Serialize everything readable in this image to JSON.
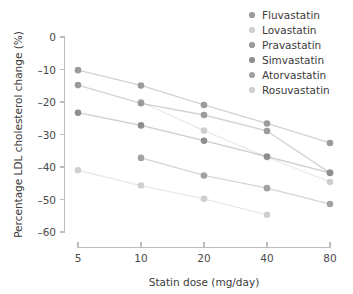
{
  "chart_data": {
    "type": "line",
    "title": "",
    "xlabel": "Statin dose (mg/day)",
    "ylabel": "Percentage LDL cholesterol change (%)",
    "x_scale": "log2-like categorical",
    "x": [
      5,
      10,
      20,
      40,
      80
    ],
    "xtick_labels": [
      "5",
      "10",
      "20",
      "40",
      "80"
    ],
    "ytick_labels": [
      "0",
      "–10",
      "–20",
      "–30",
      "–40",
      "–50",
      "–60"
    ],
    "yticks": [
      0,
      -10,
      -20,
      -30,
      -40,
      -50,
      -60
    ],
    "ylim": [
      -60,
      0
    ],
    "grid": false,
    "legend_position": "top-right",
    "series": [
      {
        "name": "Fluvastatin",
        "color": "#9b9b9b",
        "x": [
          5,
          10,
          20,
          40,
          80
        ],
        "values": [
          -10.2,
          -14.9,
          -20.9,
          -26.6,
          -32.6
        ]
      },
      {
        "name": "Lovastatin",
        "color": "#cfcfcf",
        "x": [
          10,
          20,
          40,
          80
        ],
        "values": [
          -20.0,
          -28.8,
          -37.0,
          -44.6
        ]
      },
      {
        "name": "Pravastatin",
        "color": "#9b9b9b",
        "x": [
          5,
          10,
          20,
          40,
          80
        ],
        "values": [
          -14.8,
          -20.4,
          -24.0,
          -28.9,
          -41.8
        ]
      },
      {
        "name": "Simvastatin",
        "color": "#8e8e8e",
        "x": [
          5,
          10,
          20,
          40,
          80
        ],
        "values": [
          -23.3,
          -27.2,
          -31.9,
          -36.8,
          -41.8
        ]
      },
      {
        "name": "Atorvastatin",
        "color": "#a2a2a2",
        "x": [
          10,
          20,
          40,
          80
        ],
        "values": [
          -37.2,
          -42.6,
          -46.5,
          -51.4
        ]
      },
      {
        "name": "Rosuvastatin",
        "color": "#cfcfcf",
        "x": [
          5,
          10,
          20,
          40
        ],
        "values": [
          -41.0,
          -45.7,
          -49.8,
          -54.7
        ]
      }
    ]
  },
  "legend": {
    "items": [
      {
        "label": "Fluvastatin",
        "color": "#9b9b9b"
      },
      {
        "label": "Lovastatin",
        "color": "#d0d0d0"
      },
      {
        "label": "Pravastatin",
        "color": "#9b9b9b"
      },
      {
        "label": "Simvastatin",
        "color": "#8e8e8e"
      },
      {
        "label": "Atorvastatin",
        "color": "#a2a2a2"
      },
      {
        "label": "Rosuvastatin",
        "color": "#cfcfcf"
      }
    ]
  },
  "axes": {
    "x_title": "Statin dose (mg/day)",
    "y_title": "Percentage LDL cholesterol change (%)",
    "x_ticks": [
      "5",
      "10",
      "20",
      "40",
      "80"
    ],
    "y_ticks": [
      "0",
      "–10",
      "–20",
      "–30",
      "–40",
      "–50",
      "–60"
    ]
  },
  "style": {
    "axis_color": "#bdbdbd",
    "text_color": "#3b3b3b",
    "background": "#ffffff"
  }
}
